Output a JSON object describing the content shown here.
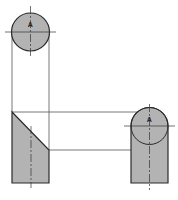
{
  "diagram": {
    "type": "orthographic-projection",
    "colors": {
      "fill": "#b3b3b3",
      "outline": "#2a2a2a",
      "projection_line": "#555555",
      "centerline": "#333333"
    },
    "views": {
      "top_view": {
        "label": "A",
        "shape": "circle"
      },
      "front_view": {
        "shape": "truncated-cylinder-slanted"
      },
      "side_view": {
        "label": "A",
        "shape": "rounded-top-rectangle"
      }
    }
  }
}
